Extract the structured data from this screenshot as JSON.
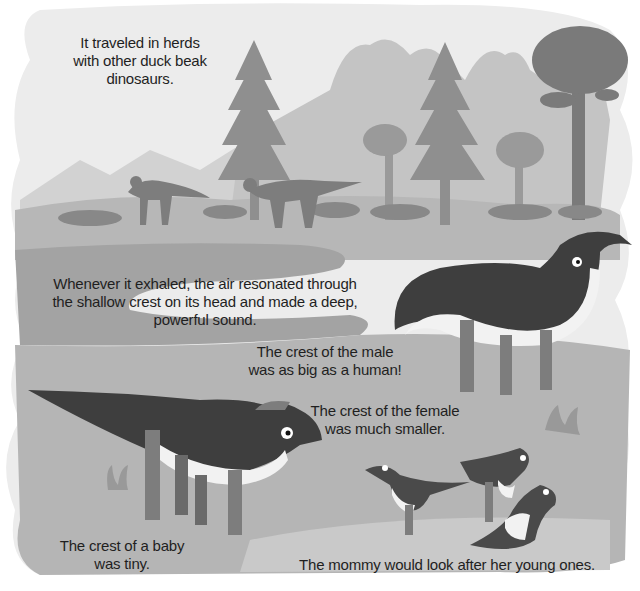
{
  "page": {
    "style": "grayscale children's book illustration",
    "colors": {
      "background": "#ffffff",
      "sky": "#ececec",
      "far_trees": "#c4c4c4",
      "mid_trees": "#a9a9a9",
      "near_trees": "#8f8f8f",
      "ground": "#b5b5b5",
      "water": "#a3a3a3",
      "dino_dark": "#3e3e3e",
      "dino_legs": "#7d7d7d",
      "dino_belly": "#f2f2f2",
      "text": "#1f1f1f"
    }
  },
  "captions": {
    "herds": "It traveled in herds\nwith other duck beak\ndinosaurs.",
    "sound": "Whenever it exhaled, the air resonated through\nthe shallow crest on its head and made a deep,\npowerful sound.",
    "male": "The crest of the male\nwas as big as a human!",
    "female": "The crest of the female\nwas much smaller.",
    "baby": "The crest of a baby\nwas tiny.",
    "mommy": "The mommy would look after her young ones."
  }
}
